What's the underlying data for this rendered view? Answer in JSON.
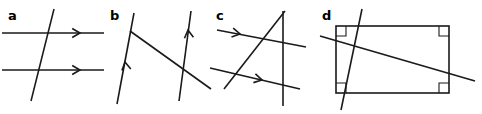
{
  "figure": {
    "width": 482,
    "height": 114,
    "background_color": "#ffffff",
    "stroke_color": "#1a1a1a"
  },
  "panels": [
    {
      "id": "a",
      "label": "a",
      "label_x": 8,
      "label_y": 20,
      "lines": [
        {
          "name": "upper-horizontal-line",
          "x1": 2,
          "y1": 33,
          "x2": 104,
          "y2": 33
        },
        {
          "name": "lower-horizontal-line",
          "x1": 2,
          "y1": 70,
          "x2": 104,
          "y2": 70
        },
        {
          "name": "transversal-line",
          "x1": 54,
          "y1": 9,
          "x2": 31,
          "y2": 101
        }
      ],
      "arrows": [
        {
          "name": "upper-arrowhead",
          "x": 80,
          "y": 33,
          "angle": 0
        },
        {
          "name": "lower-arrowhead",
          "x": 80,
          "y": 70,
          "angle": 0
        }
      ],
      "corner_marks": []
    },
    {
      "id": "b",
      "label": "b",
      "label_x": 110,
      "label_y": 20,
      "lines": [
        {
          "name": "left-line",
          "x1": 134,
          "y1": 13,
          "x2": 117,
          "y2": 104
        },
        {
          "name": "right-line",
          "x1": 191,
          "y1": 11,
          "x2": 179,
          "y2": 101
        },
        {
          "name": "transversal-line",
          "x1": 130,
          "y1": 31,
          "x2": 211,
          "y2": 89
        }
      ],
      "arrows": [
        {
          "name": "left-line-arrowhead",
          "x": 125,
          "y": 62,
          "angle": -100
        },
        {
          "name": "right-line-arrowhead",
          "x": 188,
          "y": 30,
          "angle": -97
        }
      ],
      "corner_marks": []
    },
    {
      "id": "c",
      "label": "c",
      "label_x": 216,
      "label_y": 20,
      "lines": [
        {
          "name": "vertical-line",
          "x1": 283,
          "y1": 11,
          "x2": 283,
          "y2": 106
        },
        {
          "name": "slanted-line",
          "x1": 285,
          "y1": 11,
          "x2": 224,
          "y2": 89
        },
        {
          "name": "upper-transversal-line",
          "x1": 217,
          "y1": 30,
          "x2": 306,
          "y2": 47
        },
        {
          "name": "lower-transversal-line",
          "x1": 210,
          "y1": 68,
          "x2": 300,
          "y2": 89
        }
      ],
      "arrows": [
        {
          "name": "upper-transversal-arrowhead",
          "x": 240,
          "y": 34,
          "angle": 11
        },
        {
          "name": "lower-transversal-arrowhead",
          "x": 262,
          "y": 80,
          "angle": 13
        }
      ],
      "corner_marks": []
    },
    {
      "id": "d",
      "label": "d",
      "label_x": 322,
      "label_y": 20,
      "rectangle": {
        "name": "rectangle-shape",
        "x": 336,
        "y": 26,
        "width": 113,
        "height": 67
      },
      "lines": [
        {
          "name": "diagonal-line-shallow",
          "x1": 320,
          "y1": 36,
          "x2": 475,
          "y2": 81
        },
        {
          "name": "diagonal-line-steep",
          "x1": 362,
          "y1": 9,
          "x2": 341,
          "y2": 110
        }
      ],
      "arrows": [],
      "corner_marks": [
        {
          "name": "right-angle-mark-top-left",
          "x": 336,
          "y": 26,
          "dx": 1,
          "dy": 1,
          "size": 10
        },
        {
          "name": "right-angle-mark-top-right",
          "x": 449,
          "y": 26,
          "dx": -1,
          "dy": 1,
          "size": 10
        },
        {
          "name": "right-angle-mark-bottom-left",
          "x": 336,
          "y": 93,
          "dx": 1,
          "dy": -1,
          "size": 10
        },
        {
          "name": "right-angle-mark-bottom-right",
          "x": 449,
          "y": 93,
          "dx": -1,
          "dy": -1,
          "size": 10
        }
      ]
    }
  ],
  "arrow_style": {
    "length": 9,
    "spread_degrees": 30
  }
}
